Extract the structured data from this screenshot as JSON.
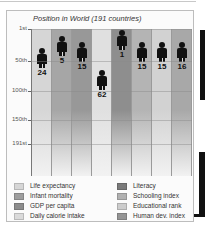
{
  "chart_data": {
    "type": "bar",
    "title": "Position in World (191 countries)",
    "xlabel": "",
    "ylabel": "",
    "ylim": [
      1,
      191
    ],
    "y_inverted": true,
    "grid": true,
    "yticks": [
      "1st",
      "50th",
      "100th",
      "150th",
      "191st"
    ],
    "categories": [
      "Life expectancy",
      "Infant mortality",
      "GDP per capita",
      "Daily calorie intake",
      "Literacy",
      "Schooling index",
      "Educational rank",
      "Human dev. index"
    ],
    "values": [
      24,
      5,
      15,
      62,
      1,
      15,
      15,
      16
    ],
    "colors": [
      "#d6d6d6",
      "#a6a6a6",
      "#989898",
      "#e0e0e0",
      "#8e8e8e",
      "#b4b4b4",
      "#d2d2d2",
      "#a8a8a8"
    ],
    "legend_position": "bottom",
    "marker": "person-icon"
  },
  "title": "Position in World (191 countries)",
  "yticks": [
    {
      "label": "1st",
      "y": 29
    },
    {
      "label": "50th",
      "y": 61
    },
    {
      "label": "100th",
      "y": 91
    },
    {
      "label": "150th",
      "y": 120
    },
    {
      "label": "191st",
      "y": 144
    }
  ],
  "bars": [
    {
      "label": "Life expectancy",
      "rank": "24",
      "color": "#d6d6d6",
      "figure_top": 42
    },
    {
      "label": "Infant mortality",
      "rank": "5",
      "color": "#a6a6a6",
      "figure_top": 30
    },
    {
      "label": "GDP per capita",
      "rank": "15",
      "color": "#989898",
      "figure_top": 36
    },
    {
      "label": "Daily calorie intake",
      "rank": "62",
      "color": "#e0e0e0",
      "figure_top": 64
    },
    {
      "label": "Literacy",
      "rank": "1",
      "color": "#8e8e8e",
      "figure_top": 24
    },
    {
      "label": "Schooling index",
      "rank": "15",
      "color": "#b4b4b4",
      "figure_top": 36
    },
    {
      "label": "Educational rank",
      "rank": "15",
      "color": "#d2d2d2",
      "figure_top": 36
    },
    {
      "label": "Human dev. index",
      "rank": "16",
      "color": "#a8a8a8",
      "figure_top": 36
    }
  ],
  "legend": {
    "left": [
      {
        "label": "Life expectancy",
        "color": "#d6d6d6"
      },
      {
        "label": "Infant mortality",
        "color": "#9e9e9e"
      },
      {
        "label": "GDP per capita",
        "color": "#8c8c8c"
      },
      {
        "label": "Daily calorie intake",
        "color": "#dadada"
      }
    ],
    "right": [
      {
        "label": "Literacy",
        "color": "#7a7a7a"
      },
      {
        "label": "Schooling index",
        "color": "#b0b0b0"
      },
      {
        "label": "Educational rank",
        "color": "#cccccc"
      },
      {
        "label": "Human dev. index",
        "color": "#949494"
      }
    ]
  }
}
